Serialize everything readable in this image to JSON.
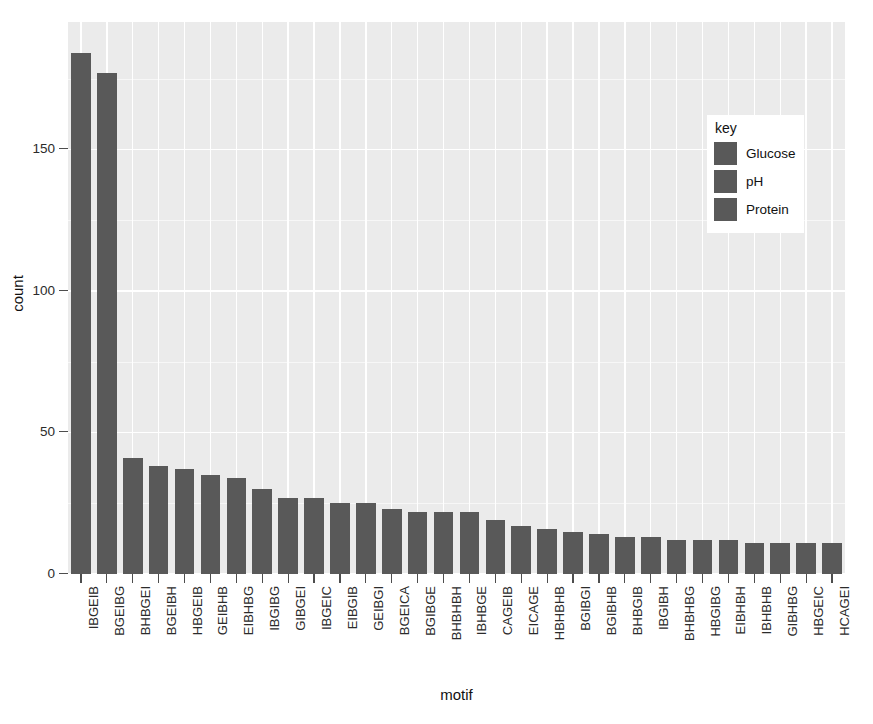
{
  "chart_data": {
    "type": "bar",
    "title": "",
    "subtitle": "",
    "xlabel": "motif",
    "ylabel": "count",
    "ylim": [
      0,
      195
    ],
    "yticks": [
      0,
      50,
      100,
      150
    ],
    "ytick_labels": [
      "0",
      "50",
      "100",
      "150"
    ],
    "grid": true,
    "legend_position": "inside-top-right",
    "legend_title": "key",
    "legend_entries": [
      "Glucose",
      "pH",
      "Protein"
    ],
    "bar_color": "#595959",
    "panel_background": "#ebebeb",
    "gridline_color": "#ffffff",
    "categories": [
      "IBGEIB",
      "BGEIBG",
      "BHBGEI",
      "BGEIBH",
      "HBGEIB",
      "GEIBHB",
      "EIBHBG",
      "IBGIBG",
      "GIBGEI",
      "IBGEIC",
      "EIBGIB",
      "GEIBGI",
      "BGEICA",
      "BGIBGE",
      "BHBHBH",
      "IBHBGE",
      "CAGEIB",
      "EICAGE",
      "HBHBHB",
      "BGIBGI",
      "BGIBHB",
      "BHBGIB",
      "IBGIBH",
      "BHBHBG",
      "HBGIBG",
      "EIBHBH",
      "IBHBHB",
      "GIBHBG",
      "HBGEIC",
      "HCAGEI"
    ],
    "values": [
      184,
      177,
      41,
      38,
      37,
      35,
      34,
      30,
      27,
      27,
      25,
      25,
      23,
      22,
      22,
      22,
      19,
      17,
      16,
      15,
      14,
      13,
      13,
      12,
      12,
      12,
      11,
      11,
      11,
      11
    ]
  },
  "legend": {
    "title": "key",
    "items": [
      {
        "label": "Glucose",
        "color": "#595959"
      },
      {
        "label": "pH",
        "color": "#595959"
      },
      {
        "label": "Protein",
        "color": "#595959"
      }
    ]
  },
  "axes": {
    "y_title": "count",
    "x_title": "motif"
  }
}
